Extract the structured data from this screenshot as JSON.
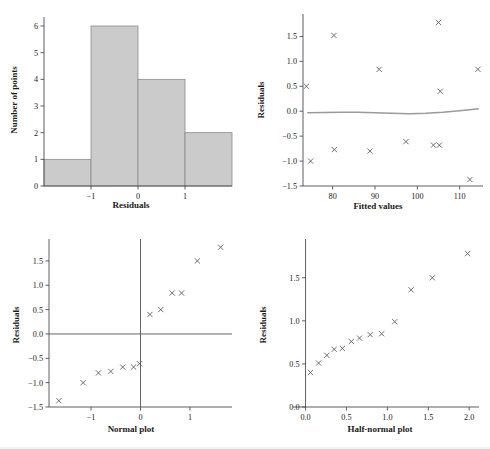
{
  "figure": {
    "title": "",
    "panel_count": 4,
    "background": "#ffffff",
    "marker_color": "#555555",
    "bar_fill": "#cbcbcb",
    "bar_stroke": "#8a8a8a",
    "smooth_color": "#9a9a9a"
  },
  "chart_data": [
    {
      "id": "histogram",
      "type": "bar",
      "title": "",
      "xlabel": "Residuals",
      "ylabel": "Number of points",
      "categories": [
        "-2 to -1",
        "-1 to 0",
        "0 to 1",
        "1 to 2"
      ],
      "bin_edges": [
        -2,
        -1,
        0,
        1,
        2
      ],
      "values": [
        1,
        6,
        4,
        2
      ],
      "xlim": [
        -2,
        2
      ],
      "ylim": [
        0,
        6.3
      ],
      "xticks": [
        -1,
        0,
        1
      ],
      "xticklabels": [
        "−1",
        "0",
        "1"
      ],
      "yticks": [
        0,
        1,
        2,
        3,
        4,
        5,
        6
      ],
      "yticklabels": [
        "0",
        "1",
        "2",
        "3",
        "4",
        "5",
        "6"
      ],
      "grid": false,
      "legend": "none"
    },
    {
      "id": "fitted-vs-residuals",
      "type": "scatter",
      "title": "",
      "xlabel": "Fitted values",
      "ylabel": "Residuals",
      "xlim": [
        73,
        115.5
      ],
      "ylim": [
        -1.5,
        1.95
      ],
      "xticks": [
        80,
        90,
        100,
        110
      ],
      "xticklabels": [
        "80",
        "90",
        "100",
        "110"
      ],
      "yticks": [
        -1.5,
        -1.0,
        -0.5,
        0.0,
        0.5,
        1.0,
        1.5
      ],
      "yticklabels": [
        "−1.5",
        "−1.0",
        "−0.5",
        "0.0",
        "0.5",
        "1.0",
        "1.5"
      ],
      "grid": false,
      "legend": "none",
      "marker": "x",
      "points": [
        {
          "x": 73.8,
          "y": 0.5
        },
        {
          "x": 74.8,
          "y": -1.0
        },
        {
          "x": 80.3,
          "y": 1.52
        },
        {
          "x": 80.4,
          "y": -0.77
        },
        {
          "x": 88.8,
          "y": -0.8
        },
        {
          "x": 91.0,
          "y": 0.84
        },
        {
          "x": 97.3,
          "y": -0.61
        },
        {
          "x": 103.8,
          "y": -0.68
        },
        {
          "x": 105.2,
          "y": -0.68
        },
        {
          "x": 105.0,
          "y": 1.78
        },
        {
          "x": 105.4,
          "y": 0.4
        },
        {
          "x": 112.4,
          "y": -1.37
        },
        {
          "x": 114.3,
          "y": 0.84
        }
      ],
      "smooth_curve": {
        "name": "loess-smooth",
        "x": [
          74.0,
          78.0,
          82.0,
          86.0,
          90.0,
          94.0,
          98.0,
          102.0,
          106.0,
          110.0,
          114.5
        ],
        "y": [
          -0.03,
          -0.025,
          -0.02,
          -0.02,
          -0.03,
          -0.04,
          -0.05,
          -0.04,
          -0.02,
          0.01,
          0.05
        ]
      }
    },
    {
      "id": "normal-plot",
      "type": "scatter",
      "title": "",
      "xlabel": "Normal plot",
      "ylabel": "Residuals",
      "xlim": [
        -1.85,
        1.85
      ],
      "ylim": [
        -1.5,
        1.95
      ],
      "xticks": [
        -1,
        0,
        1
      ],
      "xticklabels": [
        "−1",
        "0",
        "1"
      ],
      "yticks": [
        -1.5,
        -1.0,
        -0.5,
        0.0,
        0.5,
        1.0,
        1.5
      ],
      "yticklabels": [
        "−1.5",
        "−1.0",
        "−0.5",
        "0.0",
        "0.5",
        "1.0",
        "1.5"
      ],
      "grid": false,
      "legend": "none",
      "marker": "x",
      "hline": 0.0,
      "vline": 0.0,
      "points": [
        {
          "x": -1.65,
          "y": -1.37
        },
        {
          "x": -1.16,
          "y": -1.0
        },
        {
          "x": -0.85,
          "y": -0.8
        },
        {
          "x": -0.6,
          "y": -0.77
        },
        {
          "x": -0.36,
          "y": -0.68
        },
        {
          "x": -0.14,
          "y": -0.68
        },
        {
          "x": -0.02,
          "y": -0.61
        },
        {
          "x": 0.19,
          "y": 0.4
        },
        {
          "x": 0.41,
          "y": 0.5
        },
        {
          "x": 0.64,
          "y": 0.84
        },
        {
          "x": 0.83,
          "y": 0.84
        },
        {
          "x": 1.15,
          "y": 1.5
        },
        {
          "x": 1.62,
          "y": 1.78
        }
      ]
    },
    {
      "id": "half-normal-plot",
      "type": "scatter",
      "title": "",
      "xlabel": "Half-normal plot",
      "ylabel": "Residuals",
      "xlim": [
        -0.08,
        2.12
      ],
      "ylim": [
        0.0,
        1.95
      ],
      "xticks": [
        0.0,
        0.5,
        1.0,
        1.5,
        2.0
      ],
      "xticklabels": [
        "0.0",
        "0.5",
        "1.0",
        "1.5",
        "2.0"
      ],
      "yticks": [
        0.0,
        0.5,
        1.0,
        1.5
      ],
      "yticklabels": [
        "0.0",
        "0.5",
        "1.0",
        "1.5"
      ],
      "grid": false,
      "legend": "none",
      "marker": "x",
      "points": [
        {
          "x": 0.06,
          "y": 0.4
        },
        {
          "x": 0.16,
          "y": 0.51
        },
        {
          "x": 0.26,
          "y": 0.6
        },
        {
          "x": 0.35,
          "y": 0.67
        },
        {
          "x": 0.45,
          "y": 0.68
        },
        {
          "x": 0.56,
          "y": 0.76
        },
        {
          "x": 0.66,
          "y": 0.8
        },
        {
          "x": 0.79,
          "y": 0.84
        },
        {
          "x": 0.93,
          "y": 0.85
        },
        {
          "x": 1.09,
          "y": 0.99
        },
        {
          "x": 1.29,
          "y": 1.36
        },
        {
          "x": 1.55,
          "y": 1.5
        },
        {
          "x": 1.98,
          "y": 1.78
        }
      ]
    }
  ]
}
